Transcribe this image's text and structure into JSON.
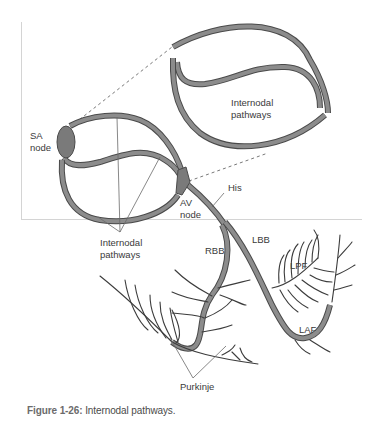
{
  "figure": {
    "caption_label": "Figure 1-26:",
    "caption_text": " Internodal pathways."
  },
  "labels": {
    "sa_node_line1": "SA",
    "sa_node_line2": "node",
    "av_node_line1": "AV",
    "av_node_line2": "node",
    "his": "His",
    "lbb": "LBB",
    "rbb": "RBB",
    "lpf": "LPF",
    "laf": "LAF",
    "purkinje": "Purkinje",
    "internodal_line1": "Internodal",
    "internodal_line2": "pathways",
    "inset_line1": "Internodal",
    "inset_line2": "pathways"
  },
  "colors": {
    "pathway_fill": "#8c8c8c",
    "pathway_stroke": "#4a4a4a",
    "node_fill": "#7a7a7a",
    "fiber": "#3c3c3c",
    "caption_label": "#6b6b6b"
  }
}
